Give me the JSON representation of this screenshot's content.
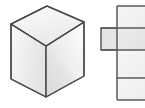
{
  "figure": {
    "width": 145,
    "height": 108,
    "background": "#ffffff",
    "caption": "",
    "parts": [
      {
        "id": "cube",
        "label": "isometric cube"
      },
      {
        "id": "net",
        "label": "cube net"
      }
    ]
  },
  "cube": {
    "label": "isometric cube",
    "outline_color": "#4a4a4a",
    "outline_width": 1.4,
    "vertices": {
      "top": [
        47,
        6
      ],
      "upper_left": [
        11,
        24
      ],
      "upper_right": [
        84,
        22
      ],
      "center": [
        46,
        46
      ],
      "lower_left": [
        11,
        79
      ],
      "lower_right": [
        84,
        76
      ],
      "bottom": [
        46,
        97
      ]
    },
    "faces": [
      {
        "id": "top-face",
        "label": "top face",
        "points": "47,6 84,22 46,46 11,24",
        "fill": "#f4f4f4",
        "gradient_from": "#fbfbfb",
        "gradient_to": "#eaeaea"
      },
      {
        "id": "left-face",
        "label": "left face",
        "points": "11,24 46,46 46,97 11,79",
        "fill": "#efefef",
        "gradient_from": "#f7f7f7",
        "gradient_to": "#e4e4e4"
      },
      {
        "id": "right-face",
        "label": "right face",
        "points": "46,46 84,22 84,76 46,97",
        "fill": "#e6e6e6",
        "gradient_from": "#dcdcdc",
        "gradient_to": "#f6f6f6",
        "sheen": "diagonal highlight from lower-left to upper-right"
      }
    ]
  },
  "net": {
    "label": "cube net (clipped at right edge)",
    "stroke_color": "#5a5a5a",
    "stroke_width": 1.5,
    "column_left": 117,
    "column_right": 145,
    "column_top": 6,
    "column_bottom": 100,
    "side_square_left": 101,
    "side_square_top": 28,
    "side_square_bottom": 50,
    "squares": [
      {
        "id": "net-square-top",
        "label": "top square of column",
        "x": 117,
        "y": 6,
        "w": 28,
        "h": 22,
        "fill": "#f2f2f2"
      },
      {
        "id": "net-square-second",
        "label": "second square of column",
        "x": 117,
        "y": 28,
        "w": 28,
        "h": 22,
        "fill": "#eaeaea"
      },
      {
        "id": "net-square-third",
        "label": "third square of column",
        "x": 117,
        "y": 50,
        "w": 28,
        "h": 28,
        "fill": "#f2f2f2"
      },
      {
        "id": "net-square-bottom",
        "label": "bottom square of column",
        "x": 117,
        "y": 78,
        "w": 28,
        "h": 22,
        "fill": "#f2f2f2"
      },
      {
        "id": "net-square-side",
        "label": "left protruding square",
        "x": 101,
        "y": 28,
        "w": 16,
        "h": 22,
        "fill": "#e3e3e3"
      }
    ],
    "divider_lines": [
      {
        "id": "net-divider-1",
        "label": "divider at y=28",
        "x1": 117,
        "y1": 28,
        "x2": 145,
        "y2": 28
      },
      {
        "id": "net-divider-2",
        "label": "divider at y=50",
        "x1": 117,
        "y1": 50,
        "x2": 145,
        "y2": 50
      },
      {
        "id": "net-divider-3",
        "label": "divider at y=78",
        "x1": 117,
        "y1": 78,
        "x2": 145,
        "y2": 78
      }
    ]
  }
}
